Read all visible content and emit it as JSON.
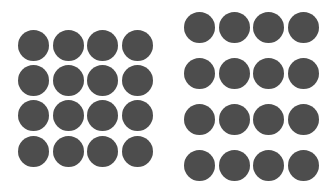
{
  "figure": {
    "dot_color": "#4d4d4d",
    "background": "#ffffff",
    "dot_diameter": 31,
    "grids": [
      {
        "name": "left-grid",
        "rows": 4,
        "cols": 4,
        "centers_x": [
          33,
          68,
          102,
          137
        ],
        "centers_y": [
          45,
          80,
          115,
          151
        ]
      },
      {
        "name": "right-grid",
        "rows": 4,
        "cols": 4,
        "centers_x": [
          199,
          234,
          268,
          303
        ],
        "centers_y": [
          27,
          73,
          119,
          165
        ]
      }
    ]
  }
}
